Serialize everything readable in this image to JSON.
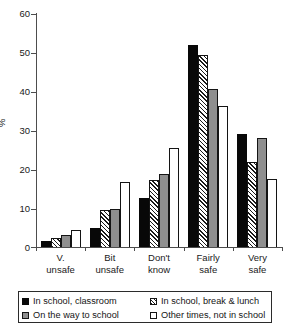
{
  "chart_data": {
    "type": "bar",
    "title": "",
    "xlabel": "",
    "ylabel": "%",
    "ylim": [
      0,
      60
    ],
    "yticks": [
      0,
      10,
      20,
      30,
      40,
      50,
      60
    ],
    "grid": false,
    "legend_position": "bottom",
    "categories": [
      "V. unsafe",
      "Bit unsafe",
      "Don't know",
      "Fairly safe",
      "Very safe"
    ],
    "category_lines": [
      [
        "V.",
        "unsafe"
      ],
      [
        "Bit",
        "unsafe"
      ],
      [
        "Don't",
        "know"
      ],
      [
        "Fairly",
        "safe"
      ],
      [
        "Very",
        "safe"
      ]
    ],
    "series": [
      {
        "name": "In school, classroom",
        "fill": "solid-black",
        "color": "#080808",
        "values": [
          1.6,
          5.0,
          12.7,
          52.0,
          29.0
        ]
      },
      {
        "name": "In school, break & lunch",
        "fill": "diagonal-hatch",
        "color": "#ffffff",
        "values": [
          2.2,
          9.5,
          17.3,
          49.4,
          22.0
        ]
      },
      {
        "name": "On the way to school",
        "fill": "solid-gray",
        "color": "#8f8f8f",
        "values": [
          3.1,
          9.8,
          18.8,
          40.8,
          28.0
        ]
      },
      {
        "name": "Other times, not in school",
        "fill": "solid-white",
        "color": "#ffffff",
        "values": [
          4.4,
          16.7,
          25.5,
          36.2,
          17.5
        ]
      }
    ]
  },
  "axis": {
    "y_tick_labels": [
      "60",
      "50",
      "40",
      "30",
      "20",
      "10",
      "0"
    ],
    "y_axis_title": "%"
  },
  "legend": {
    "items": [
      {
        "label": "In school, classroom"
      },
      {
        "label": "In school, break & lunch"
      },
      {
        "label": "On the way to school"
      },
      {
        "label": "Other times, not in school"
      }
    ]
  }
}
